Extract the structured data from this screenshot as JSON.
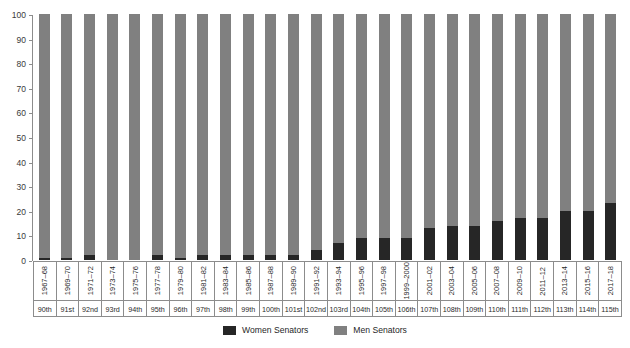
{
  "chart_data": {
    "type": "bar",
    "subtype": "stacked-percentage",
    "title": "",
    "xlabel": "",
    "ylabel": "",
    "ylim": [
      0,
      100
    ],
    "ytick_values": [
      0,
      10,
      20,
      30,
      40,
      50,
      60,
      70,
      80,
      90,
      100
    ],
    "ytick_labels": [
      "0",
      "10",
      "20",
      "30",
      "40",
      "50",
      "60",
      "70",
      "80",
      "90",
      "100"
    ],
    "grid": false,
    "legend_position": "bottom-center",
    "categories": [
      "1967–68",
      "1969–70",
      "1971–72",
      "1973–74",
      "1975–76",
      "1977–78",
      "1979–80",
      "1981–82",
      "1983–84",
      "1985–86",
      "1987–88",
      "1989–90",
      "1991–92",
      "1993–94",
      "1995–96",
      "1997–98",
      "1999–2000",
      "2001–02",
      "2003–04",
      "2005–06",
      "2007–08",
      "2009–10",
      "2011–12",
      "2013–14",
      "2015–16",
      "2017–18"
    ],
    "congress_labels": [
      "90th",
      "91st",
      "92nd",
      "93rd",
      "94th",
      "95th",
      "96th",
      "97th",
      "98th",
      "99th",
      "100th",
      "101st",
      "102nd",
      "103rd",
      "104th",
      "105th",
      "106th",
      "107th",
      "108th",
      "109th",
      "110th",
      "111th",
      "112th",
      "113th",
      "114th",
      "115th"
    ],
    "series": [
      {
        "name": "Women Senators",
        "color": "#262626",
        "values": [
          1,
          1,
          2,
          0,
          0,
          2,
          1,
          2,
          2,
          2,
          2,
          2,
          4,
          7,
          9,
          9,
          9,
          13,
          14,
          14,
          16,
          17,
          17,
          20,
          20,
          23
        ]
      },
      {
        "name": "Men Senators",
        "color": "#808080",
        "values": [
          99,
          99,
          98,
          100,
          100,
          98,
          99,
          98,
          98,
          98,
          98,
          98,
          96,
          93,
          91,
          91,
          91,
          87,
          86,
          86,
          84,
          83,
          83,
          80,
          80,
          77
        ]
      }
    ]
  },
  "legend": {
    "items": [
      {
        "label": "Women Senators",
        "color": "#262626"
      },
      {
        "label": "Men Senators",
        "color": "#808080"
      }
    ]
  }
}
